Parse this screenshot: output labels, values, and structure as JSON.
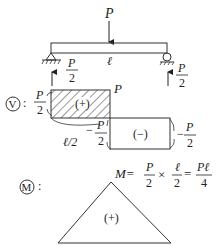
{
  "beam": {
    "load_label": "P",
    "span_label": "ℓ",
    "left_reaction": {
      "num": "P",
      "den": "2"
    },
    "right_reaction": {
      "num": "P",
      "den": "2"
    }
  },
  "shear_diagram": {
    "symbol": "V",
    "colon": ":",
    "left_value": {
      "num": "P",
      "den": "2"
    },
    "top_right_label": "P",
    "positive_sign": "(+)",
    "negative_sign": "(−)",
    "mid_label": "ℓ/2",
    "mid_neg_value": {
      "sign": "−",
      "num": "P",
      "den": "2"
    },
    "right_value": {
      "sign": "−",
      "num": "P",
      "den": "2"
    }
  },
  "moment_diagram": {
    "symbol": "M",
    "colon": ":",
    "formula": {
      "lhs": "M=",
      "f1": {
        "num": "P",
        "den": "2"
      },
      "times": "×",
      "f2": {
        "num": "ℓ",
        "den": "2"
      },
      "eq": "=",
      "f3": {
        "num": "Pℓ",
        "den": "4"
      }
    },
    "positive_sign": "(+)"
  },
  "colors": {
    "line": "#333333",
    "text": "#222222",
    "background": "#ffffff"
  }
}
